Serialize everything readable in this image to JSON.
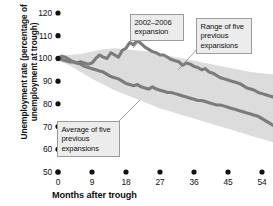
{
  "chart_data": {
    "type": "line",
    "title": "",
    "subtitle": "",
    "xlabel": "Months after trough",
    "ylabel": "Unemployment rate (percentage of unemployment at trough)",
    "xlim": [
      0,
      57
    ],
    "ylim": [
      50,
      120
    ],
    "xticks": [
      0,
      9,
      18,
      27,
      36,
      45,
      54
    ],
    "yticks": [
      50,
      60,
      70,
      80,
      90,
      100,
      110,
      120
    ],
    "grid": false,
    "legend_position": "annotations",
    "annotations": [
      {
        "id": "expansion",
        "text": "2002–2006 expansion",
        "target_series": "2002-2006 expansion"
      },
      {
        "id": "range",
        "text": "Range of five previous expansions",
        "target_series": "Range of five previous expansions"
      },
      {
        "id": "average",
        "text": "Average of five previous expansions",
        "target_series": "Average of five previous expansions"
      }
    ],
    "colors": {
      "line": "#7b7b7b",
      "band": "#dcdcdc",
      "axis_text": "#111111",
      "callout_bg": "#ececec",
      "callout_border": "#9b9b9b",
      "background": "#ffffff"
    },
    "series": [
      {
        "name": "2002-2006 expansion",
        "style": "thick-line",
        "color": "#7b7b7b",
        "x": [
          0,
          1,
          2,
          3,
          4,
          5,
          6,
          7,
          8,
          9,
          10,
          11,
          12,
          13,
          14,
          15,
          16,
          17,
          18,
          19,
          20,
          21,
          22,
          23,
          24,
          25,
          26,
          27,
          28,
          29,
          30,
          31,
          32,
          33,
          34,
          35,
          36,
          37,
          38,
          39,
          40,
          41,
          42,
          43,
          44,
          45,
          46,
          47,
          48,
          49,
          50,
          51,
          52,
          53,
          54,
          55,
          56,
          57
        ],
        "values": [
          100,
          101,
          100.5,
          99.5,
          98.5,
          98,
          98.5,
          98,
          97.5,
          98,
          100,
          101.5,
          100.5,
          100,
          102.5,
          101.5,
          100.5,
          103.5,
          104.5,
          107,
          106,
          108,
          106.5,
          105,
          104,
          103,
          102.5,
          101.5,
          101.5,
          100.5,
          99.5,
          99,
          98.5,
          97,
          98,
          97.5,
          96.5,
          96,
          95,
          95.5,
          94,
          93.5,
          92.5,
          91.5,
          91,
          90.5,
          90,
          89.5,
          89,
          88,
          87,
          86.5,
          86,
          85,
          84.5,
          84,
          83.5,
          83
        ]
      },
      {
        "name": "Average of five previous expansions",
        "style": "thick-line",
        "color": "#7b7b7b",
        "x": [
          0,
          1,
          2,
          3,
          4,
          5,
          6,
          7,
          8,
          9,
          10,
          11,
          12,
          13,
          14,
          15,
          16,
          17,
          18,
          19,
          20,
          21,
          22,
          23,
          24,
          25,
          26,
          27,
          28,
          29,
          30,
          31,
          32,
          33,
          34,
          35,
          36,
          37,
          38,
          39,
          40,
          41,
          42,
          43,
          44,
          45,
          46,
          47,
          48,
          49,
          50,
          51,
          52,
          53,
          54,
          55,
          56,
          57
        ],
        "values": [
          100,
          99.5,
          99,
          98.5,
          98.5,
          98,
          97.5,
          96.5,
          96,
          95.5,
          95,
          94.5,
          94,
          93,
          92,
          91.5,
          91,
          90,
          89,
          88.5,
          88,
          88.5,
          87.5,
          87,
          86.5,
          87.5,
          86.5,
          86,
          85.5,
          85,
          85,
          84.5,
          84,
          83.5,
          83,
          82.5,
          82,
          81.5,
          81.5,
          81,
          80.5,
          80,
          79.5,
          79.5,
          79,
          78.5,
          78,
          77.5,
          77,
          76.5,
          76,
          75.5,
          75,
          74.5,
          73.5,
          72.5,
          71.5,
          70.5
        ]
      },
      {
        "name": "Range of five previous expansions",
        "style": "band",
        "color": "#dcdcdc",
        "x": [
          0,
          3,
          6,
          9,
          12,
          15,
          18,
          21,
          24,
          27,
          30,
          33,
          36,
          39,
          42,
          45,
          48,
          51,
          54,
          57
        ],
        "upper": [
          101,
          101.5,
          102,
          103,
          104,
          104.5,
          104,
          103.5,
          103,
          102,
          101,
          100,
          99,
          98,
          97,
          96,
          95,
          94,
          93.5,
          93
        ],
        "lower": [
          99,
          97,
          94,
          91,
          88.5,
          86,
          84,
          82,
          80,
          78,
          76.5,
          75,
          73.5,
          72,
          70.5,
          69,
          67.5,
          66,
          64.5,
          63
        ]
      }
    ]
  }
}
